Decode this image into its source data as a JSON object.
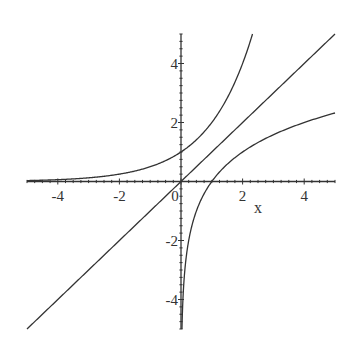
{
  "chart_data": {
    "type": "line",
    "title": "",
    "xlabel": "x",
    "ylabel": "",
    "xlim": [
      -5,
      5
    ],
    "ylim": [
      -5,
      5
    ],
    "grid": false,
    "legend": null,
    "x_ticks": [
      -4,
      -2,
      0,
      2,
      4
    ],
    "y_ticks": [
      -4,
      -2,
      2,
      4
    ],
    "x_tick_labels": [
      "-4",
      "-2",
      "0",
      "2",
      "4"
    ],
    "y_tick_labels": [
      "-4",
      "-2",
      "2",
      "4"
    ],
    "minor_ticks_per_unit": 4,
    "series": [
      {
        "name": "y = 2^x",
        "x": [
          -5,
          -4,
          -3,
          -2,
          -1,
          0,
          1,
          2,
          2.32
        ],
        "y": [
          0.03,
          0.06,
          0.13,
          0.25,
          0.5,
          1,
          2,
          4,
          5
        ]
      },
      {
        "name": "y = x",
        "x": [
          -5,
          5
        ],
        "y": [
          -5,
          5
        ]
      },
      {
        "name": "y = log2(x)",
        "x": [
          0.031,
          0.0625,
          0.125,
          0.25,
          0.5,
          1,
          2,
          3,
          4,
          5
        ],
        "y": [
          -5,
          -4,
          -3,
          -2,
          -1,
          0,
          1,
          1.58,
          2,
          2.32
        ]
      }
    ],
    "color": "#333333"
  }
}
